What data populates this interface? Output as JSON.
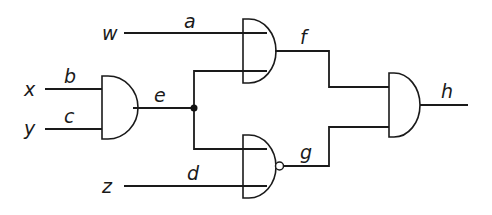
{
  "diagram": {
    "type": "logic-circuit",
    "inputs": {
      "w": "w",
      "x": "x",
      "y": "y",
      "z": "z"
    },
    "wires": {
      "a": "a",
      "b": "b",
      "c": "c",
      "d": "d",
      "e": "e",
      "f": "f",
      "g": "g",
      "h": "h"
    },
    "gates": [
      {
        "id": "gate1",
        "type": "AND",
        "inputs": [
          "b",
          "c"
        ],
        "output": "e"
      },
      {
        "id": "gate2",
        "type": "AND",
        "inputs": [
          "a",
          "e"
        ],
        "output": "f"
      },
      {
        "id": "gate3",
        "type": "NAND",
        "inputs": [
          "e",
          "d"
        ],
        "output": "g"
      },
      {
        "id": "gate4",
        "type": "AND",
        "inputs": [
          "f",
          "g"
        ],
        "output": "h"
      }
    ],
    "connections": [
      {
        "from": "w",
        "wire": "a",
        "to": "gate2"
      },
      {
        "from": "x",
        "wire": "b",
        "to": "gate1"
      },
      {
        "from": "y",
        "wire": "c",
        "to": "gate1"
      },
      {
        "from": "z",
        "wire": "d",
        "to": "gate3"
      },
      {
        "from": "gate1",
        "wire": "e",
        "to": [
          "gate2",
          "gate3"
        ]
      },
      {
        "from": "gate2",
        "wire": "f",
        "to": "gate4"
      },
      {
        "from": "gate3",
        "wire": "g",
        "to": "gate4"
      },
      {
        "from": "gate4",
        "wire": "h",
        "to": "output"
      }
    ],
    "colors": {
      "line": "#1a1a1a",
      "background": "#ffffff"
    }
  }
}
